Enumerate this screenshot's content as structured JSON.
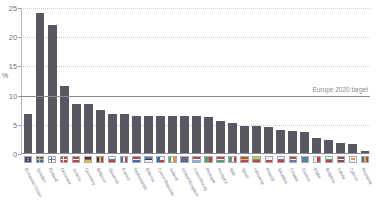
{
  "chart_data": {
    "type": "bar",
    "title": "",
    "subtitle": "",
    "xlabel": "",
    "ylabel": "%",
    "ylim": [
      0,
      25
    ],
    "yticks": [
      0,
      5,
      10,
      15,
      20,
      25
    ],
    "ytick_labels": [
      "0",
      "5",
      "10",
      "15",
      "20",
      "25"
    ],
    "grid": true,
    "legend": false,
    "bar_color": "#585862",
    "gridline_color": "#c9c9cf",
    "axis_color": "#8e8e98",
    "annotations": [
      {
        "name": "europe-2020-target-line",
        "label": "Europe 2020 target",
        "value": 10,
        "color": "#8b8b94",
        "position": "right"
      }
    ],
    "categories": [
      "European Union",
      "Sweden",
      "Finland",
      "Denmark",
      "Austria",
      "Germany",
      "Belgium",
      "Slovenia",
      "France",
      "Netherlands",
      "Estonia",
      "Czech Republic",
      "Ireland",
      "United Kingdom",
      "Luxembourg",
      "Portugal",
      "Hungary",
      "Italy",
      "Spain",
      "Lithuania",
      "Poland",
      "Slovakia",
      "Croatia",
      "Greece",
      "Malta",
      "Bulgaria",
      "Latvia",
      "Cyprus",
      "Romania"
    ],
    "values": [
      6.6,
      24.0,
      22.0,
      11.5,
      8.4,
      8.4,
      7.3,
      6.7,
      6.6,
      6.4,
      6.4,
      6.4,
      6.4,
      6.3,
      6.3,
      6.1,
      5.4,
      5.2,
      4.7,
      4.6,
      4.4,
      3.9,
      3.8,
      3.6,
      2.6,
      2.3,
      1.8,
      1.5,
      0.4
    ],
    "flags": [
      {
        "code": "EU",
        "kind": "eu"
      },
      {
        "code": "SE",
        "kind": "nordic",
        "c1": "#3b6fa8",
        "c2": "#d8c04a"
      },
      {
        "code": "FI",
        "kind": "nordic",
        "c1": "#f2f2f4",
        "c2": "#5a7fae"
      },
      {
        "code": "DK",
        "kind": "nordic",
        "c1": "#b44a4a",
        "c2": "#f2f2f4"
      },
      {
        "code": "AT",
        "kind": "hbands3",
        "c1": "#b44a4a",
        "c2": "#f2f2f4",
        "c3": "#b44a4a"
      },
      {
        "code": "DE",
        "kind": "hbands3",
        "c1": "#3a3a3f",
        "c2": "#b44a4a",
        "c3": "#d8c04a"
      },
      {
        "code": "BE",
        "kind": "vbands3",
        "c1": "#3a3a3f",
        "c2": "#d8c04a",
        "c3": "#b44a4a"
      },
      {
        "code": "SI",
        "kind": "hbands3",
        "c1": "#f2f2f4",
        "c2": "#5a7fae",
        "c3": "#b44a4a"
      },
      {
        "code": "FR",
        "kind": "vbands3",
        "c1": "#3b6fa8",
        "c2": "#f2f2f4",
        "c3": "#b44a4a"
      },
      {
        "code": "NL",
        "kind": "hbands3",
        "c1": "#b44a4a",
        "c2": "#f2f2f4",
        "c3": "#3b6fa8"
      },
      {
        "code": "EE",
        "kind": "hbands3",
        "c1": "#5a7fae",
        "c2": "#3a3a3f",
        "c3": "#f2f2f4"
      },
      {
        "code": "CZ",
        "kind": "wedge",
        "c1": "#f2f2f4",
        "c2": "#b44a4a",
        "c3": "#3b6fa8"
      },
      {
        "code": "IE",
        "kind": "vbands3",
        "c1": "#5d9e6e",
        "c2": "#f2f2f4",
        "c3": "#d89a4a"
      },
      {
        "code": "UK",
        "kind": "union",
        "c1": "#3b6fa8",
        "c2": "#f2f2f4",
        "c3": "#b44a4a"
      },
      {
        "code": "LU",
        "kind": "hbands3",
        "c1": "#b44a4a",
        "c2": "#f2f2f4",
        "c3": "#7fb2d8"
      },
      {
        "code": "PT",
        "kind": "vbands2",
        "c1": "#5d9e6e",
        "c2": "#b44a4a"
      },
      {
        "code": "HU",
        "kind": "hbands3",
        "c1": "#b44a4a",
        "c2": "#f2f2f4",
        "c3": "#5d9e6e"
      },
      {
        "code": "IT",
        "kind": "vbands3",
        "c1": "#5d9e6e",
        "c2": "#f2f2f4",
        "c3": "#b44a4a"
      },
      {
        "code": "ES",
        "kind": "hbands3",
        "c1": "#b44a4a",
        "c2": "#d8c04a",
        "c3": "#b44a4a"
      },
      {
        "code": "LT",
        "kind": "hbands3",
        "c1": "#d8c04a",
        "c2": "#5d9e6e",
        "c3": "#b44a4a"
      },
      {
        "code": "PL",
        "kind": "hbands2",
        "c1": "#f2f2f4",
        "c2": "#b44a4a"
      },
      {
        "code": "SK",
        "kind": "hbands3",
        "c1": "#f2f2f4",
        "c2": "#5a7fae",
        "c3": "#b44a4a"
      },
      {
        "code": "HR",
        "kind": "hbands3",
        "c1": "#b44a4a",
        "c2": "#f2f2f4",
        "c3": "#5a7fae"
      },
      {
        "code": "GR",
        "kind": "stripes",
        "c1": "#5a7fae",
        "c2": "#f2f2f4"
      },
      {
        "code": "MT",
        "kind": "vbands2",
        "c1": "#f2f2f4",
        "c2": "#b44a4a"
      },
      {
        "code": "BG",
        "kind": "hbands3",
        "c1": "#f2f2f4",
        "c2": "#5d9e6e",
        "c3": "#b44a4a"
      },
      {
        "code": "LV",
        "kind": "hbands3",
        "c1": "#8d4a4a",
        "c2": "#f2f2f4",
        "c3": "#8d4a4a"
      },
      {
        "code": "CY",
        "kind": "plain",
        "c1": "#f2f2f4",
        "c2": "#d89a4a"
      },
      {
        "code": "RO",
        "kind": "vbands3",
        "c1": "#3b6fa8",
        "c2": "#d8c04a",
        "c3": "#b44a4a"
      }
    ]
  }
}
